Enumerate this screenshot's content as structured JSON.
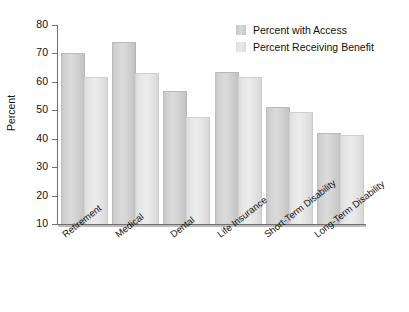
{
  "chart_data": {
    "type": "bar",
    "title": "",
    "subtitle": "",
    "xlabel": "",
    "ylabel": "Percent",
    "ylim": [
      10,
      80
    ],
    "ytick_step": 10,
    "ytick_labels": [
      "80",
      "70",
      "60",
      "50",
      "40",
      "30",
      "20",
      "10"
    ],
    "ytick_values": [
      80,
      70,
      60,
      50,
      40,
      30,
      20,
      10
    ],
    "grid": false,
    "legend_position": "top-right",
    "categories": [
      "Retirement",
      "Medical",
      "Dental",
      "Life Insurance",
      "Short-Term Disability",
      "Long-Term Disability"
    ],
    "series": [
      {
        "name": "Percent with Access",
        "color": "#d4d4d4",
        "values": [
          69.8,
          73.5,
          56.4,
          63.0,
          50.8,
          41.8
        ]
      },
      {
        "name": "Percent Receiving Benefit",
        "color": "#e8e8e8",
        "values": [
          61.3,
          62.6,
          47.3,
          61.2,
          49.0,
          41.0
        ]
      }
    ]
  },
  "axis": {
    "y_title": "Percent"
  },
  "legend": {
    "items": [
      {
        "label": "Percent with Access",
        "swatch": "legend-swatch-access"
      },
      {
        "label": "Percent Receiving Benefit",
        "swatch": "legend-swatch-benefit"
      }
    ]
  }
}
